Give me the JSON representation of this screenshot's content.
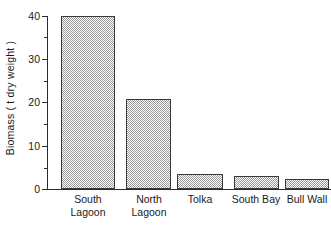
{
  "chart_data": {
    "type": "bar",
    "title": "",
    "xlabel": "",
    "ylabel": "Biomass ( t dry weight )",
    "categories": [
      "South Lagoon",
      "North Lagoon",
      "Tolka",
      "South Bay",
      "Bull Wall"
    ],
    "values": [
      40,
      20.7,
      3.5,
      3.0,
      2.3
    ],
    "ylim": [
      0,
      40
    ],
    "y_major_ticks": [
      0,
      10,
      20,
      30,
      40
    ],
    "y_minor_ticks": [
      5,
      15,
      25,
      35
    ],
    "grid": false,
    "legend": null,
    "bar_fill": "#9a9a9a",
    "bar_edge": "#3a3a3a",
    "axis_color": "#2b2b2b",
    "background": "#ffffff"
  },
  "axes": {
    "y_title": "Biomass ( t dry weight )",
    "y_tick_labels": [
      "0",
      "10",
      "20",
      "30",
      "40"
    ]
  },
  "bars": [
    {
      "label_line1": "South",
      "label_line2": "Lagoon",
      "value": 40
    },
    {
      "label_line1": "North",
      "label_line2": "Lagoon",
      "value": 20.7
    },
    {
      "label_line1": "Tolka",
      "label_line2": "",
      "value": 3.5
    },
    {
      "label_line1": "South Bay",
      "label_line2": "",
      "value": 3.0
    },
    {
      "label_line1": "Bull Wall",
      "label_line2": "",
      "value": 2.3
    }
  ]
}
